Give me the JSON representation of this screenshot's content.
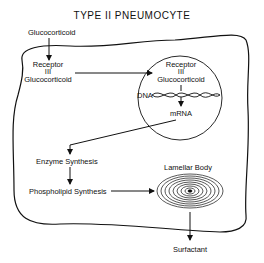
{
  "title": "TYPE II PNEUMOCYTE",
  "labels": {
    "glucocorticoid_outside": "Glucocorticoid",
    "receptor_cyto": "Receptor",
    "bond_cyto": "III",
    "glucocorticoid_cyto": "Glucocorticoid",
    "receptor_nucleus": "Receptor",
    "bond_nucleus": "III",
    "glucocorticoid_nucleus": "Glucocorticoid",
    "dna": "DNA",
    "mrna": "mRNA",
    "enzyme_synthesis": "Enzyme Synthesis",
    "phospholipid_synthesis": "Phospholipid Synthesis",
    "lamellar_body": "Lamellar Body",
    "surfactant": "Surfactant"
  },
  "colors": {
    "stroke": "#111111",
    "background": "#ffffff"
  }
}
